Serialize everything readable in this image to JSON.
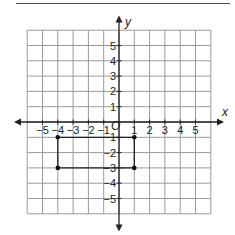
{
  "chart_data": {
    "type": "scatter",
    "title": "",
    "xlabel": "x",
    "ylabel": "y",
    "origin_label": "O",
    "xlim": [
      -6,
      6
    ],
    "ylim": [
      -6,
      6
    ],
    "grid": true,
    "x_ticks": [
      -5,
      -4,
      -3,
      -2,
      -1,
      1,
      2,
      3,
      4,
      5
    ],
    "y_ticks": [
      5,
      4,
      3,
      2,
      1,
      -1,
      -2,
      -3,
      -4,
      -5
    ],
    "x_tick_labels": [
      "−5",
      "−4",
      "−3",
      "−2",
      "−1",
      "1",
      "2",
      "3",
      "4",
      "5"
    ],
    "y_tick_labels": [
      "5",
      "4",
      "3",
      "2",
      "1",
      "−1",
      "−2",
      "−3",
      "−4",
      "−5"
    ],
    "points": [
      {
        "x": -4,
        "y": -1
      },
      {
        "x": 1,
        "y": -1
      },
      {
        "x": 1,
        "y": -3
      },
      {
        "x": -4,
        "y": -3
      }
    ],
    "shape": "rectangle",
    "polygon": [
      [
        -4,
        -1
      ],
      [
        1,
        -1
      ],
      [
        1,
        -3
      ],
      [
        -4,
        -3
      ]
    ]
  }
}
